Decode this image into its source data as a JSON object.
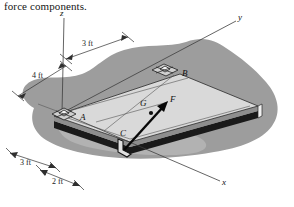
{
  "caption": {
    "text": "force components."
  },
  "figure": {
    "name": "plate-force-diagram",
    "axes": [
      {
        "id": "z",
        "label": "z"
      },
      {
        "id": "y",
        "label": "y"
      },
      {
        "id": "x",
        "label": "x"
      }
    ],
    "points": [
      {
        "id": "A",
        "label": "A",
        "kind": "eyelet-fixture"
      },
      {
        "id": "B",
        "label": "B",
        "kind": "eyelet-fixture"
      },
      {
        "id": "C",
        "label": "C",
        "kind": "hook-bracket"
      },
      {
        "id": "G",
        "label": "G",
        "kind": "center-of-gravity-dot"
      }
    ],
    "force": {
      "label": "F",
      "applied_at": "C",
      "direction": "up-right"
    },
    "dimensions": [
      {
        "id": "d-3ft-top",
        "label": "3 ft"
      },
      {
        "id": "d-4ft-left",
        "label": "4 ft"
      },
      {
        "id": "d-3ft-bottom",
        "label": "3 ft"
      },
      {
        "id": "d-2ft-bottom",
        "label": "2 ft"
      }
    ],
    "colors": {
      "plate_top": "#d8d8d8",
      "plate_edge_dark": "#141414",
      "shadow": "#9a9a9a",
      "shadow_light": "#c6c6c6",
      "line": "#2a2a2a",
      "text": "#111111",
      "background": "#ffffff"
    }
  }
}
